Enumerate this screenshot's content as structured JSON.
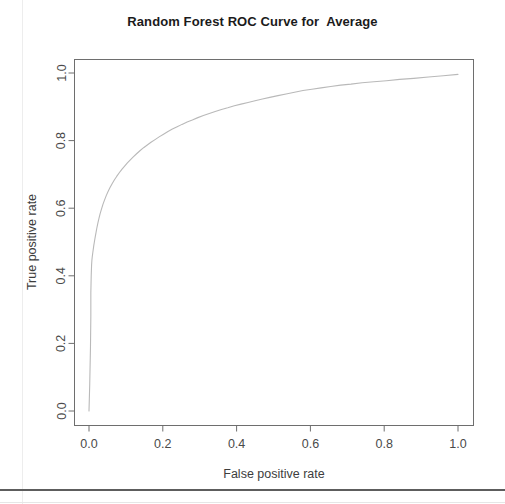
{
  "figure": {
    "title": "Random Forest ROC Curve for  Average",
    "background_color": "#ffffff",
    "frame_color": "#6e6e6e",
    "curve_color": "#b9b9b9",
    "text_color": "#3d3d3d"
  },
  "chart_data": {
    "type": "line",
    "title": "Random Forest ROC Curve for  Average",
    "xlabel": "False positive rate",
    "ylabel": "True positive rate",
    "xlim": [
      0,
      1
    ],
    "ylim": [
      0,
      1
    ],
    "xticks": [
      "0.0",
      "0.2",
      "0.4",
      "0.6",
      "0.8",
      "1.0"
    ],
    "yticks": [
      "0.0",
      "0.2",
      "0.4",
      "0.6",
      "0.8",
      "1.0"
    ],
    "xtick_values": [
      0.0,
      0.2,
      0.4,
      0.6,
      0.8,
      1.0
    ],
    "ytick_values": [
      0.0,
      0.2,
      0.4,
      0.6,
      0.8,
      1.0
    ],
    "grid": false,
    "legend": false,
    "series": [
      {
        "name": "ROC curve",
        "color": "#b9b9b9",
        "x": [
          0.0,
          0.002,
          0.004,
          0.005,
          0.005,
          0.006,
          0.007,
          0.008,
          0.009,
          0.01,
          0.011,
          0.012,
          0.013,
          0.015,
          0.017,
          0.019,
          0.021,
          0.024,
          0.027,
          0.03,
          0.034,
          0.038,
          0.042,
          0.047,
          0.052,
          0.057,
          0.063,
          0.069,
          0.075,
          0.082,
          0.089,
          0.096,
          0.104,
          0.112,
          0.12,
          0.129,
          0.138,
          0.148,
          0.158,
          0.168,
          0.179,
          0.19,
          0.202,
          0.214,
          0.226,
          0.239,
          0.252,
          0.266,
          0.28,
          0.295,
          0.31,
          0.326,
          0.342,
          0.359,
          0.376,
          0.394,
          0.412,
          0.431,
          0.45,
          0.47,
          0.49,
          0.512,
          0.534,
          0.557,
          0.58,
          0.604,
          0.629,
          0.655,
          0.682,
          0.71,
          0.74,
          0.772,
          0.806,
          0.842,
          0.88,
          0.92,
          0.96,
          1.0
        ],
        "y": [
          0.0,
          0.08,
          0.19,
          0.28,
          0.35,
          0.4,
          0.432,
          0.448,
          0.458,
          0.466,
          0.474,
          0.482,
          0.49,
          0.503,
          0.516,
          0.528,
          0.54,
          0.556,
          0.57,
          0.583,
          0.598,
          0.612,
          0.624,
          0.638,
          0.65,
          0.661,
          0.673,
          0.684,
          0.694,
          0.705,
          0.715,
          0.724,
          0.734,
          0.743,
          0.752,
          0.761,
          0.77,
          0.779,
          0.787,
          0.795,
          0.803,
          0.811,
          0.819,
          0.827,
          0.834,
          0.841,
          0.848,
          0.855,
          0.861,
          0.868,
          0.874,
          0.88,
          0.886,
          0.892,
          0.897,
          0.903,
          0.908,
          0.913,
          0.918,
          0.923,
          0.928,
          0.933,
          0.938,
          0.943,
          0.948,
          0.952,
          0.956,
          0.96,
          0.964,
          0.967,
          0.971,
          0.974,
          0.977,
          0.981,
          0.984,
          0.988,
          0.992,
          0.996
        ]
      }
    ]
  }
}
